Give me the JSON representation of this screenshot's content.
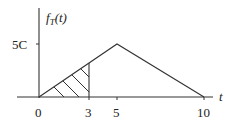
{
  "diagram": {
    "type": "probability-density-plot",
    "y_axis_label": {
      "func": "f",
      "subscript": "T",
      "arg": "(t)"
    },
    "x_axis_label": "t",
    "y_ticks": [
      {
        "label": "5C",
        "value": 5
      }
    ],
    "x_ticks": [
      {
        "label": "0",
        "value": 0
      },
      {
        "label": "3",
        "value": 3
      },
      {
        "label": "5",
        "value": 5
      },
      {
        "label": "10",
        "value": 10
      }
    ],
    "curve": {
      "shape": "triangle",
      "points": [
        {
          "t": 0,
          "f": 0
        },
        {
          "t": 5,
          "f": 5
        },
        {
          "t": 10,
          "f": 0
        }
      ],
      "peak_label": "5C"
    },
    "shaded_region": {
      "from": 0,
      "to": 3,
      "style": "hatched",
      "height_at_end": 3
    },
    "colors": {
      "line": "#333333",
      "background": "#ffffff"
    }
  }
}
